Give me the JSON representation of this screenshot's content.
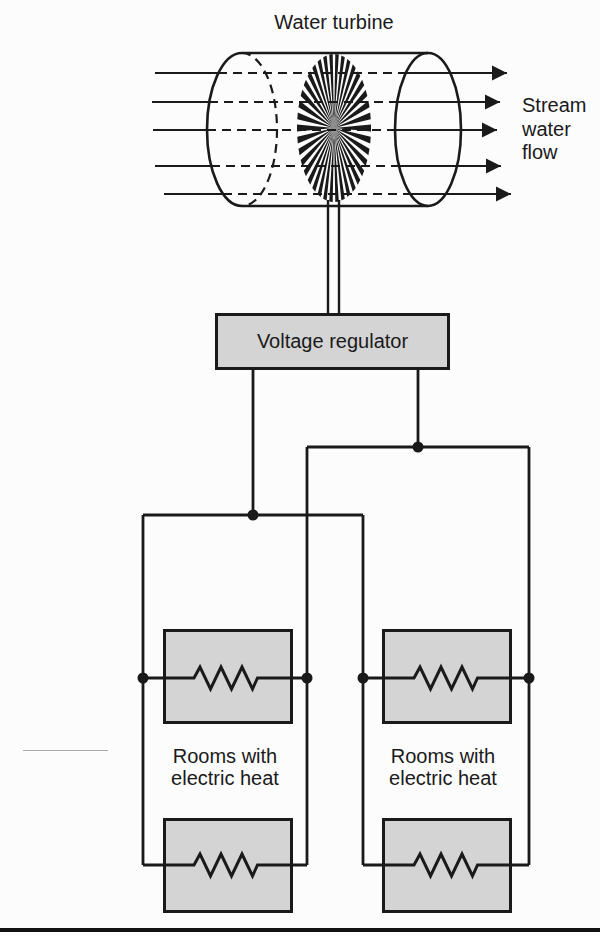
{
  "title": "Water turbine",
  "flow_label": [
    "Stream",
    "water",
    "flow"
  ],
  "regulator": {
    "label": "Voltage regulator"
  },
  "rooms_caption": [
    "Rooms with",
    "electric heat"
  ],
  "icons": {
    "turbine": "starburst-rotor",
    "flow_arrow": "right-arrow"
  },
  "colors": {
    "line": "#1a1a1a",
    "box-fill": "#d4d4d4",
    "page-bg": "#fcfcfc",
    "rule": "#111111"
  }
}
